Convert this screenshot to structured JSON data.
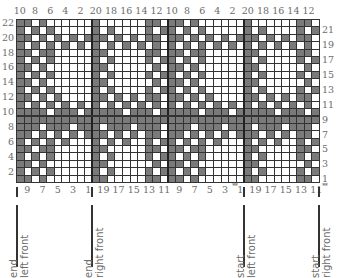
{
  "chart": {
    "top_labels": [
      "10",
      "8",
      "6",
      "4",
      "2",
      "20",
      "18",
      "16",
      "14",
      "12",
      "10",
      "8",
      "6",
      "4",
      "2",
      "20",
      "18",
      "16",
      "14",
      "12"
    ],
    "left_labels": [
      "22",
      "20",
      "18",
      "16",
      "14",
      "12",
      "10",
      "8",
      "6",
      "4",
      "2"
    ],
    "right_labels": [
      "21",
      "19",
      "17",
      "15",
      "13",
      "11",
      "9",
      "7",
      "5",
      "3",
      "1"
    ],
    "bottom_labels": [
      "9",
      "7",
      "5",
      "3",
      "1",
      "19",
      "17",
      "15",
      "13",
      "11",
      "9",
      "7",
      "5",
      "3",
      "1",
      "19",
      "17",
      "15",
      "13",
      "11"
    ],
    "stars_left": "**",
    "stars_right": "**",
    "rows": 22,
    "cols": 40,
    "colors": {
      "dark": "#7a7a7a",
      "light": "#ffffff",
      "grid": "#333333"
    },
    "pattern_rows_top_to_bottom": [
      "1101000000100000011011010000001000000110",
      "1010100000101000010110101000001010000101",
      "1101010101110101011011010101011101010110",
      "1010101010101010101010101010101010101010",
      "1101100000110000011011011000001100000110",
      "1010100000101000010110101000001010000101",
      "1101000000110000001011010000001100000010",
      "1010100000101000010110101000001010000101",
      "1101000000110000001011010000001100000010",
      "1010100000101000010110101000001010000101",
      "1101010000110101011011010100001101010110",
      "1010101010101010101010101010101010101010",
      "1111011101111101110111110111011111011101",
      "1111111111111111111111111111111111111111",
      "1110111011101110111011101110111011101110",
      "1101010101110101011011010101011101010110",
      "1010101000101010010110101010001010100101",
      "1101100000110000011011011000001100000110",
      "1010100000101000010110101000001010000101",
      "1101000000110000001011010000001100000010",
      "1010100000101000010110101000001010000101",
      "1101000000110000011011010000001100000110"
    ],
    "heavy_vertical_after_cols": [
      10,
      20,
      30
    ],
    "heavy_horizontal_after_row_from_top": 13
  },
  "annotations": [
    {
      "line1": "end",
      "line2": "left front"
    },
    {
      "line1": "end",
      "line2": "right front"
    },
    {
      "line1": "start",
      "line2": "left front"
    },
    {
      "line1": "start",
      "line2": "right front"
    }
  ]
}
